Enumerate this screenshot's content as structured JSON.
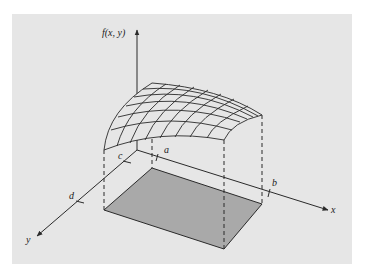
{
  "figure": {
    "type": "3d-surface-over-rectangle",
    "colors": {
      "background": "#e6e6e6",
      "lines": "#2a2a2a",
      "shaded_region": "#a9a9a9"
    },
    "axes": {
      "z_label": "f(x, y)",
      "x_label": "x",
      "y_label": "y"
    },
    "ticks": {
      "x_ticks": [
        "a",
        "b"
      ],
      "y_ticks": [
        "c",
        "d"
      ]
    },
    "surface": {
      "grid_rows": 6,
      "grid_cols": 8
    }
  }
}
